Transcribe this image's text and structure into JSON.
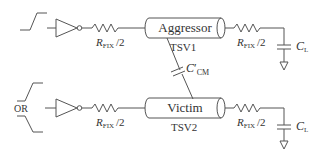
{
  "diagram": {
    "type": "circuit",
    "aggressor": {
      "label": "Aggressor",
      "tsv_label": "TSV1",
      "input": "rising-step"
    },
    "victim": {
      "label": "Victim",
      "tsv_label": "TSV2",
      "input_options_label": "OR"
    },
    "resistor_label_main": "R",
    "resistor_label_sub": "FIX",
    "resistor_label_suffix": "/2",
    "coupling_cap_label_main": "C",
    "coupling_cap_label_prime": "′",
    "coupling_cap_label_sub": "CM",
    "load_cap_label_main": "C",
    "load_cap_label_sub": "L"
  }
}
